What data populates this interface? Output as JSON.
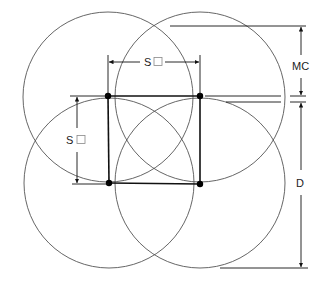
{
  "diagram": {
    "labels": {
      "spacing_horizontal": "S",
      "spacing_vertical": "S",
      "mc": "MC",
      "d": "D"
    },
    "colors": {
      "circle_stroke": "#555555",
      "line_stroke": "#111111",
      "dot_fill": "#000000",
      "background": "#ffffff"
    },
    "circles": [
      {
        "name": "top-left",
        "cx": 108,
        "cy": 97,
        "r": 85
      },
      {
        "name": "top-right",
        "cx": 200,
        "cy": 97,
        "r": 85
      },
      {
        "name": "bottom-left",
        "cx": 109,
        "cy": 183,
        "r": 85
      },
      {
        "name": "bottom-right",
        "cx": 200,
        "cy": 183,
        "r": 85
      }
    ],
    "heads": [
      {
        "name": "top-left",
        "x": 108,
        "y": 96
      },
      {
        "name": "top-right",
        "x": 200,
        "y": 96
      },
      {
        "name": "bottom-left",
        "x": 109,
        "y": 183
      },
      {
        "name": "bottom-right",
        "x": 200,
        "y": 184
      }
    ]
  }
}
